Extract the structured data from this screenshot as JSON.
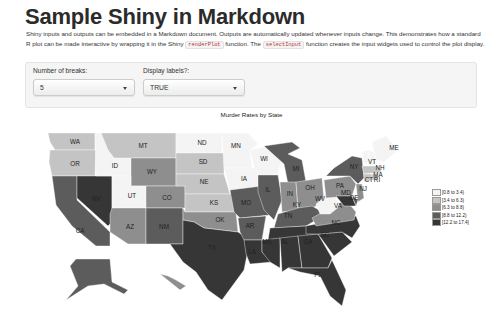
{
  "page": {
    "title": "Sample Shiny in Markdown",
    "description": {
      "part1": "Shiny inputs and outputs can be embedded in a Markdown document. Outputs are automatically updated whenever inputs change. This demonstrates how a standard R plot can be made interactive by wrapping it in the Shiny ",
      "code1": "renderPlot",
      "part2": " function. The ",
      "code2": "selectInput",
      "part3": " function creates the input widgets used to control the plot display."
    }
  },
  "inputs": {
    "breaks": {
      "label": "Number of breaks:",
      "value": "5",
      "icon": "chevron-down-icon"
    },
    "labels": {
      "label": "Display labels?:",
      "value": "TRUE",
      "icon": "chevron-down-icon"
    }
  },
  "plot": {
    "title": "Murder Rates by State",
    "legend": [
      {
        "label": "[0.8 to 3.4)",
        "color": "#f4f4f4"
      },
      {
        "label": "[3.4 to 6.3)",
        "color": "#c4c4c4"
      },
      {
        "label": "[6.3 to 8.8)",
        "color": "#8e8e8e"
      },
      {
        "label": "[8.8 to 12.2)",
        "color": "#5c5c5c"
      },
      {
        "label": "[12.2 to 17.4]",
        "color": "#363636"
      }
    ],
    "states": [
      "WA",
      "OR",
      "CA",
      "NV",
      "ID",
      "MT",
      "WY",
      "UT",
      "CO",
      "AZ",
      "NM",
      "ND",
      "SD",
      "NE",
      "KS",
      "OK",
      "TX",
      "MN",
      "IA",
      "MO",
      "AR",
      "LA",
      "WI",
      "IL",
      "MI",
      "IN",
      "OH",
      "KY",
      "TN",
      "MS",
      "AL",
      "GA",
      "FL",
      "SC",
      "NC",
      "VA",
      "WV",
      "PA",
      "NY",
      "NJ",
      "MD",
      "DE",
      "VT",
      "NH",
      "ME",
      "MA",
      "CT",
      "RI"
    ]
  }
}
